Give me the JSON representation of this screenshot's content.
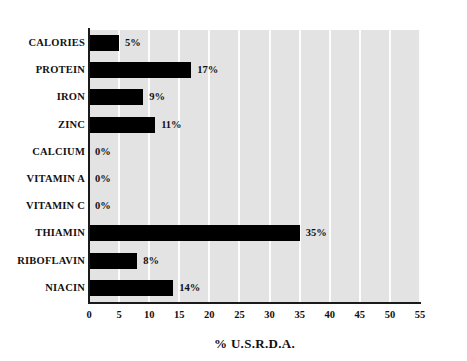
{
  "chart_data": {
    "type": "bar",
    "orientation": "horizontal",
    "title": "",
    "xlabel": "% U.S.R.D.A.",
    "ylabel": "",
    "categories": [
      "CALORIES",
      "PROTEIN",
      "IRON",
      "ZINC",
      "CALCIUM",
      "VITAMIN A",
      "VITAMIN C",
      "THIAMIN",
      "RIBOFLAVIN",
      "NIACIN"
    ],
    "values": [
      5,
      17,
      9,
      11,
      0,
      0,
      0,
      35,
      8,
      14
    ],
    "value_labels": [
      "5%",
      "17%",
      "9%",
      "11%",
      "0%",
      "0%",
      "0%",
      "35%",
      "8%",
      "14%"
    ],
    "xlim": [
      0,
      55
    ],
    "xticks": [
      0,
      5,
      10,
      15,
      20,
      25,
      30,
      35,
      40,
      45,
      50,
      55
    ],
    "xtick_labels": [
      "0",
      "5",
      "10",
      "15",
      "20",
      "25",
      "30",
      "35",
      "40",
      "45",
      "50",
      "55"
    ],
    "grid": "vertical",
    "legend": "none",
    "colors": {
      "bar": "#000000",
      "plot_background": "#e3e3e3",
      "gridline": "#fdfdfd",
      "axis_line": "#1a1a1a",
      "text": "#111111",
      "page_background": "#ffffff"
    }
  }
}
